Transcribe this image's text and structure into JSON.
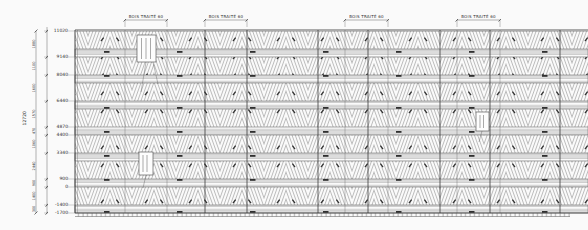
{
  "drawing": {
    "top_dimensions": {
      "labels": [
        "BOIS TRAITÉ 60",
        "BOIS TRAITÉ 60",
        "BOIS TRAITÉ 60",
        "BOIS TRAITÉ 60"
      ]
    },
    "elevations": [
      "11020",
      "9140",
      "8040",
      "6440",
      "4870",
      "4400",
      "3340",
      "900",
      "0",
      "-1400",
      "-1700"
    ],
    "intervals": [
      "1880",
      "1100",
      "1600",
      "1570",
      "470",
      "1060",
      "2440",
      "900",
      "1400",
      "300"
    ],
    "overall_dimension": "12720",
    "colors": {
      "background": "#fafafa",
      "line": "#3a3a3a",
      "hatch": "#6e6e6e",
      "rail": "#8a8a8a"
    }
  }
}
